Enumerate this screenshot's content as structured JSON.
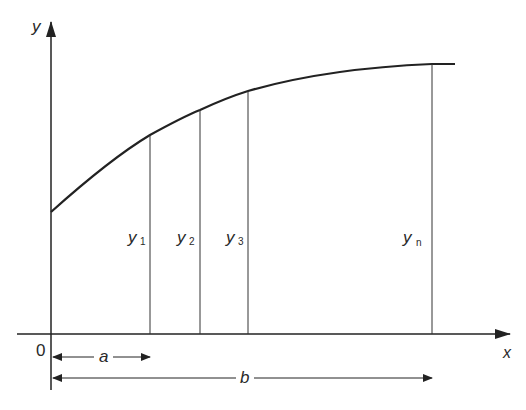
{
  "diagram": {
    "axes": {
      "x_label": "x",
      "y_label": "y",
      "origin_label": "0"
    },
    "ordinates": [
      {
        "label": "y",
        "subscript": "1"
      },
      {
        "label": "y",
        "subscript": "2"
      },
      {
        "label": "y",
        "subscript": "3"
      },
      {
        "label": "y",
        "subscript": "n"
      }
    ],
    "dimensions": [
      {
        "label": "a"
      },
      {
        "label": "b"
      }
    ],
    "colors": {
      "line": "#222222",
      "background": "#ffffff"
    }
  }
}
